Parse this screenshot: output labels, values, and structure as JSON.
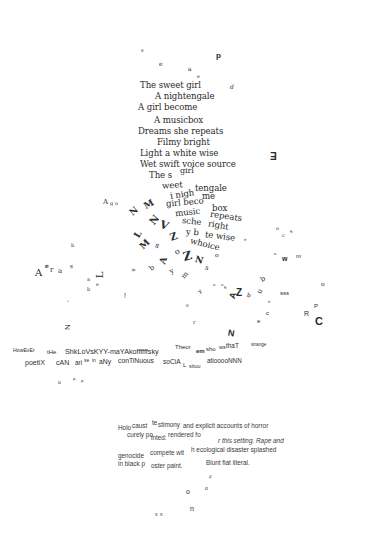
{
  "page": {
    "background": "#ffffff",
    "ink": "#2a2a2a"
  },
  "poem_intact": {
    "lines": [
      "The sweet girl",
      "A nightengale",
      "A girl become",
      "A musicbox",
      "Dreams she repeats",
      "Filmy bright",
      "Light a white wise",
      "Wet swift voice source"
    ]
  },
  "poem_fragmenting": {
    "lines": [
      "The s",
      "girl",
      "weet",
      "tengale",
      "i nigh",
      "me",
      "girl beco",
      "box",
      "music",
      "repeats",
      "sche",
      "right",
      "y b",
      "te wise",
      "whoice"
    ]
  },
  "scattered_glyphs": {
    "top": [
      "p",
      "e",
      "a",
      "e",
      "d",
      "s"
    ],
    "right_mark": "E",
    "left_cluster": [
      "A",
      "g",
      "o",
      "A",
      "e",
      "r",
      "a",
      "b",
      "L",
      "a",
      "e",
      "b",
      "s",
      "!",
      "N",
      "Z"
    ],
    "center_swirl": [
      "N",
      "M",
      "N",
      "L",
      "Z",
      "V",
      "Z",
      "A",
      "N",
      "M",
      "s",
      "o",
      "b",
      "y",
      "m"
    ],
    "right_scatter": [
      "o",
      "c",
      "w",
      "m",
      "o",
      "sss",
      "e",
      "c",
      "R",
      "P",
      "C",
      "A",
      "Z",
      "N",
      "r",
      "e",
      "u"
    ],
    "bottom": [
      "o",
      "n",
      "o",
      "x",
      "x",
      "n"
    ]
  },
  "wave_text": {
    "line1": "HowEvEr iHe ShkLoVsKYY-maYAkoffffffsky Theorem sho ws thaT strange",
    "line2": "poetiX cAN arise in aNy conTiNuous soCiAL situuatiooooNNN",
    "line1_parts": [
      "HowEvEr",
      "tHe",
      "ShkLoVsKYY-maYAkoffffffsky",
      "Theor",
      "em",
      "sho",
      "ws",
      "thaT",
      "strange"
    ],
    "line2_parts": [
      "poetiX",
      "cAN",
      "ari",
      "se",
      "in",
      "aNy",
      "conTiNuous",
      "soCiA",
      "L",
      "situu",
      "atiooooNNN"
    ]
  },
  "prose_block": {
    "lines": [
      "Holocaust testimony and explicit accounts of horror",
      "curely po",
      "inted: rendered fo",
      "r this setting. Rape and",
      "genocide compete with ecological disaster splashed",
      "in black poster paint.",
      "Blunt flat literal."
    ],
    "parts": {
      "l1a": "Holo",
      "l1b": "caust",
      "l1c": "te",
      "l1d": "stimony",
      "l1e": "and explicit accounts of horror",
      "l2a": "curely po",
      "l2b": "inted:",
      "l2c": "rendered fo",
      "l2d": "r this setting. Rape and",
      "l3a": "genocide",
      "l3b": "compete wit",
      "l3c": "h ecological disaster splashed",
      "l4a": "in black p",
      "l4b": "oster paint.",
      "l4c": "Blunt flat literal."
    }
  }
}
